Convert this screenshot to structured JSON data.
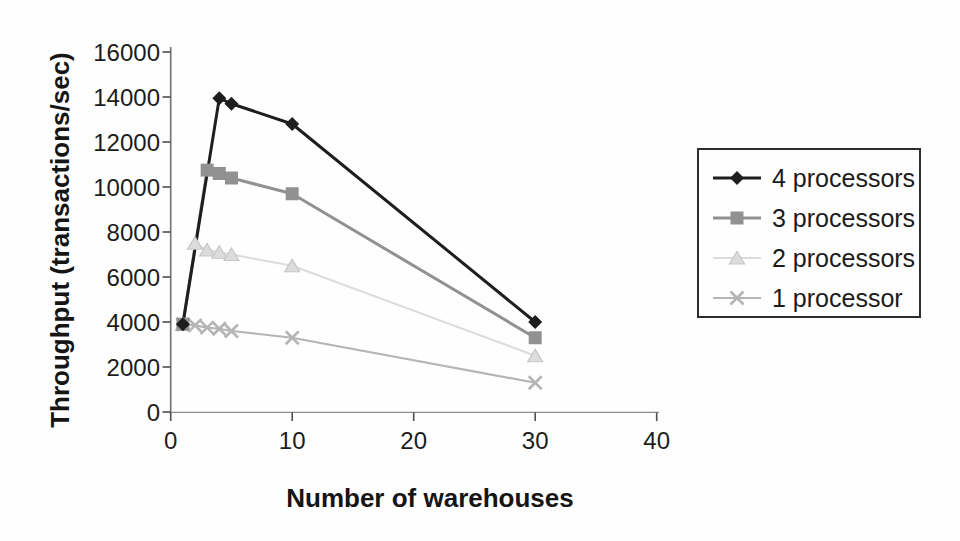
{
  "figure": {
    "background_color": "#fefefe",
    "text_color": "#1b1b1b"
  },
  "chart_data": {
    "type": "line",
    "title": "",
    "xlabel": "Number of warehouses",
    "ylabel": "Throughput (transactions/sec)",
    "xlim": [
      0,
      40
    ],
    "ylim": [
      0,
      16000
    ],
    "x_ticks": [
      0,
      10,
      20,
      30,
      40
    ],
    "y_ticks": [
      0,
      2000,
      4000,
      6000,
      8000,
      10000,
      12000,
      14000,
      16000
    ],
    "grid": false,
    "legend_position": "right",
    "axis_color": "#8c8c8c",
    "tick_color": "#4f4f4f",
    "series": [
      {
        "name": "4 processors",
        "marker": "diamond",
        "color": "#1e1e1e",
        "x": [
          1,
          4,
          5,
          10,
          30
        ],
        "y": [
          3900,
          13950,
          13700,
          12800,
          4000
        ]
      },
      {
        "name": "3 processors",
        "marker": "square",
        "color": "#919191",
        "x": [
          1,
          3,
          4,
          5,
          10,
          30
        ],
        "y": [
          3900,
          10750,
          10600,
          10400,
          9700,
          3300
        ]
      },
      {
        "name": "2 processors",
        "marker": "triangle",
        "color": "#dcdcdc",
        "marker_outline": "#c6c6c6",
        "x": [
          1,
          2,
          3,
          4,
          5,
          10,
          30
        ],
        "y": [
          3900,
          7500,
          7200,
          7100,
          7000,
          6500,
          2500
        ]
      },
      {
        "name": "1 processor",
        "marker": "x",
        "color": "#b5b5b5",
        "x": [
          1,
          2,
          3,
          4,
          5,
          10,
          30
        ],
        "y": [
          3900,
          3850,
          3750,
          3700,
          3600,
          3300,
          1300
        ]
      }
    ]
  }
}
